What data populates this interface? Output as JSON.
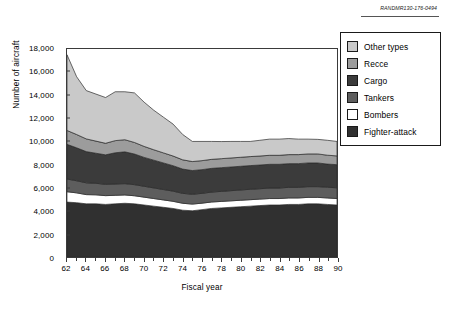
{
  "credit": "RANDMR130-176-0494",
  "legend": {
    "items": [
      {
        "label": "Other types",
        "color": "#c9c9c9"
      },
      {
        "label": "Recce",
        "color": "#9c9c9c"
      },
      {
        "label": "Cargo",
        "color": "#3b3b3b"
      },
      {
        "label": "Tankers",
        "color": "#5d5d5d"
      },
      {
        "label": "Bombers",
        "color": "#ffffff"
      },
      {
        "label": "Fighter-attack",
        "color": "#303030"
      }
    ]
  },
  "chart_data": {
    "type": "area",
    "stacked": true,
    "title": "",
    "xlabel": "Fiscal year",
    "ylabel": "Number of aircraft",
    "xlim": [
      62,
      90
    ],
    "ylim": [
      0,
      18000
    ],
    "ytick_values": [
      0,
      2000,
      4000,
      6000,
      8000,
      10000,
      12000,
      14000,
      16000,
      18000
    ],
    "ytick_labels": [
      "0",
      "2,000",
      "4,000",
      "6,000",
      "8,000",
      "10,000",
      "12,000",
      "14,000",
      "16,000",
      "18,000"
    ],
    "xtick_values": [
      62,
      64,
      66,
      68,
      70,
      72,
      74,
      76,
      78,
      80,
      82,
      84,
      86,
      88,
      90
    ],
    "xtick_labels": [
      "62",
      "64",
      "66",
      "68",
      "70",
      "72",
      "74",
      "76",
      "78",
      "80",
      "82",
      "84",
      "86",
      "88",
      "90"
    ],
    "x": [
      62,
      63,
      64,
      65,
      66,
      67,
      68,
      69,
      70,
      71,
      72,
      73,
      74,
      75,
      76,
      77,
      78,
      79,
      80,
      81,
      82,
      83,
      84,
      85,
      86,
      87,
      88,
      89,
      90
    ],
    "grid": false,
    "legend_position": "top-right",
    "stack_order_bottom_to_top": [
      "Fighter-attack",
      "Bombers",
      "Tankers",
      "Cargo",
      "Recce",
      "Other types"
    ],
    "series": [
      {
        "name": "Fighter-attack",
        "color": "#303030",
        "values": [
          4750,
          4700,
          4600,
          4600,
          4550,
          4600,
          4650,
          4600,
          4500,
          4400,
          4300,
          4200,
          4050,
          4000,
          4100,
          4200,
          4250,
          4300,
          4350,
          4400,
          4450,
          4500,
          4500,
          4550,
          4550,
          4600,
          4600,
          4550,
          4500
        ]
      },
      {
        "name": "Bombers",
        "color": "#ffffff",
        "values": [
          900,
          850,
          800,
          780,
          760,
          740,
          720,
          700,
          680,
          660,
          640,
          620,
          600,
          580,
          560,
          560,
          560,
          560,
          560,
          560,
          560,
          560,
          560,
          560,
          560,
          560,
          560,
          560,
          560
        ]
      },
      {
        "name": "Tankers",
        "color": "#5d5d5d",
        "values": [
          1100,
          1050,
          1020,
          1000,
          980,
          980,
          980,
          960,
          940,
          920,
          900,
          880,
          860,
          850,
          850,
          860,
          870,
          880,
          890,
          900,
          900,
          910,
          910,
          920,
          920,
          930,
          930,
          930,
          930
        ]
      },
      {
        "name": "Cargo",
        "color": "#3b3b3b",
        "values": [
          3000,
          2850,
          2700,
          2600,
          2550,
          2700,
          2750,
          2650,
          2500,
          2400,
          2300,
          2200,
          2100,
          2050,
          2050,
          2050,
          2050,
          2050,
          2050,
          2050,
          2050,
          2050,
          2050,
          2050,
          2050,
          2050,
          2050,
          2000,
          2000
        ]
      },
      {
        "name": "Recce",
        "color": "#9c9c9c",
        "values": [
          1200,
          1150,
          1100,
          1050,
          1000,
          1050,
          1050,
          1000,
          950,
          900,
          870,
          840,
          800,
          780,
          780,
          780,
          780,
          780,
          780,
          780,
          780,
          780,
          780,
          780,
          780,
          780,
          780,
          770,
          760
        ]
      },
      {
        "name": "Other types",
        "color": "#c9c9c9",
        "values": [
          6550,
          5000,
          4180,
          4070,
          3960,
          4230,
          4150,
          4290,
          3830,
          3420,
          3090,
          2760,
          2190,
          1740,
          1660,
          1550,
          1480,
          1430,
          1370,
          1310,
          1360,
          1400,
          1400,
          1390,
          1340,
          1280,
          1260,
          1290,
          1250
        ]
      }
    ],
    "totals": [
      17500,
      15600,
      14400,
      14100,
      13800,
      14300,
      14300,
      14200,
      13400,
      12700,
      12100,
      11500,
      10600,
      10000,
      10000,
      10000,
      9990,
      10000,
      10000,
      10000,
      10100,
      10200,
      10200,
      10250,
      10200,
      10200,
      10180,
      10100,
      10000
    ]
  }
}
